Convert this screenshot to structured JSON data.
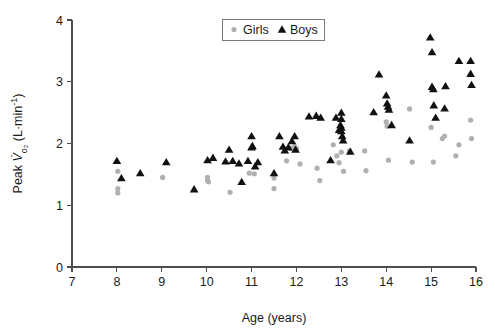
{
  "chart_data": {
    "type": "scatter",
    "title": "",
    "xlabel": "Age (years)",
    "ylabel": "Peak V̇o₂ (L·min⁻¹)",
    "ylabel_parts": {
      "prefix": "Peak ",
      "symbol": "V̇",
      "sub": "o₂",
      "units_open": " (L·min",
      "units_sup": "-1",
      "units_close": ")"
    },
    "xlim": [
      7,
      16
    ],
    "ylim": [
      0,
      4
    ],
    "xticks": [
      7,
      8,
      9,
      10,
      11,
      12,
      13,
      14,
      15,
      16
    ],
    "yticks": [
      0,
      1,
      2,
      3,
      4
    ],
    "xtick_labels": [
      "7",
      "8",
      "9",
      "10",
      "11",
      "12",
      "13",
      "14",
      "15",
      "16"
    ],
    "ytick_labels": [
      "0",
      "1",
      "2",
      "3",
      "4"
    ],
    "grid": false,
    "legend_position": "top-center",
    "colors": {
      "girls": "#b0b0b0",
      "boys": "#111111",
      "axis": "#4d4d4d",
      "text": "#1a1a1a",
      "legend_border": "#7a7a7a",
      "background": "#ffffff"
    },
    "series": [
      {
        "name": "Girls",
        "marker": "circle",
        "color": "#b0b0b0",
        "points": [
          [
            8.02,
            1.55
          ],
          [
            8.02,
            1.27
          ],
          [
            8.02,
            1.2
          ],
          [
            9.02,
            1.45
          ],
          [
            10.02,
            1.45
          ],
          [
            10.02,
            1.4
          ],
          [
            10.04,
            1.38
          ],
          [
            10.52,
            1.21
          ],
          [
            10.95,
            1.52
          ],
          [
            11.06,
            1.51
          ],
          [
            11.5,
            1.44
          ],
          [
            11.5,
            1.27
          ],
          [
            11.78,
            1.72
          ],
          [
            11.88,
            1.92
          ],
          [
            11.96,
            1.95
          ],
          [
            12.0,
            1.92
          ],
          [
            12.08,
            1.67
          ],
          [
            12.46,
            1.6
          ],
          [
            12.52,
            1.4
          ],
          [
            12.82,
            1.98
          ],
          [
            12.9,
            1.8
          ],
          [
            12.95,
            1.69
          ],
          [
            13.0,
            1.86
          ],
          [
            13.05,
            1.55
          ],
          [
            13.18,
            1.88
          ],
          [
            13.52,
            1.88
          ],
          [
            13.55,
            1.56
          ],
          [
            14.0,
            2.35
          ],
          [
            14.02,
            2.28
          ],
          [
            14.05,
            1.73
          ],
          [
            14.52,
            2.56
          ],
          [
            14.58,
            1.7
          ],
          [
            15.0,
            2.26
          ],
          [
            15.05,
            1.7
          ],
          [
            15.25,
            2.08
          ],
          [
            15.3,
            2.12
          ],
          [
            15.55,
            1.8
          ],
          [
            15.62,
            1.98
          ],
          [
            15.88,
            2.38
          ],
          [
            15.9,
            2.08
          ]
        ]
      },
      {
        "name": "Boys",
        "marker": "triangle",
        "color": "#111111",
        "points": [
          [
            8.0,
            1.72
          ],
          [
            8.1,
            1.44
          ],
          [
            8.52,
            1.52
          ],
          [
            9.1,
            1.7
          ],
          [
            9.72,
            1.26
          ],
          [
            10.02,
            1.73
          ],
          [
            10.14,
            1.77
          ],
          [
            10.42,
            1.71
          ],
          [
            10.5,
            1.9
          ],
          [
            10.58,
            1.72
          ],
          [
            10.72,
            1.68
          ],
          [
            10.78,
            1.38
          ],
          [
            10.92,
            1.72
          ],
          [
            11.0,
            2.12
          ],
          [
            11.0,
            1.94
          ],
          [
            11.02,
            1.96
          ],
          [
            11.08,
            1.63
          ],
          [
            11.14,
            1.7
          ],
          [
            11.5,
            1.52
          ],
          [
            11.62,
            2.12
          ],
          [
            11.7,
            1.95
          ],
          [
            11.74,
            1.89
          ],
          [
            11.82,
            1.94
          ],
          [
            11.9,
            2.04
          ],
          [
            11.96,
            2.12
          ],
          [
            11.98,
            1.9
          ],
          [
            12.28,
            2.44
          ],
          [
            12.44,
            2.45
          ],
          [
            12.54,
            2.42
          ],
          [
            12.76,
            1.73
          ],
          [
            12.88,
            2.42
          ],
          [
            12.95,
            2.22
          ],
          [
            12.98,
            2.3
          ],
          [
            13.0,
            2.5
          ],
          [
            13.0,
            2.4
          ],
          [
            13.0,
            2.26
          ],
          [
            13.0,
            2.2
          ],
          [
            13.02,
            2.12
          ],
          [
            13.04,
            2.05
          ],
          [
            13.2,
            1.87
          ],
          [
            13.72,
            2.51
          ],
          [
            13.84,
            3.12
          ],
          [
            14.0,
            2.78
          ],
          [
            14.02,
            2.65
          ],
          [
            14.04,
            2.6
          ],
          [
            14.06,
            2.55
          ],
          [
            14.12,
            2.3
          ],
          [
            14.52,
            2.05
          ],
          [
            14.98,
            3.72
          ],
          [
            15.02,
            3.48
          ],
          [
            15.02,
            2.92
          ],
          [
            15.05,
            2.88
          ],
          [
            15.06,
            2.62
          ],
          [
            15.1,
            2.42
          ],
          [
            15.3,
            2.57
          ],
          [
            15.32,
            2.93
          ],
          [
            15.62,
            3.34
          ],
          [
            15.88,
            3.34
          ],
          [
            15.88,
            3.13
          ],
          [
            15.9,
            2.95
          ]
        ]
      }
    ],
    "legend": [
      {
        "label": "Girls",
        "marker": "circle",
        "color": "#b0b0b0"
      },
      {
        "label": "Boys",
        "marker": "triangle",
        "color": "#111111"
      }
    ]
  },
  "geometry": {
    "x_px_at_min": 72,
    "x_px_at_max": 476,
    "y_px_at_min": 267,
    "y_px_at_max": 20
  }
}
